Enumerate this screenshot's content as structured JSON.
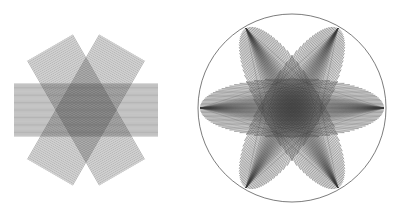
{
  "canvas": {
    "width": 398,
    "height": 220,
    "background": "#ffffff",
    "stroke_color": "#3a3a3a",
    "stroke_width": 0.38,
    "title": ""
  },
  "figures": [
    {
      "id": "left-figure",
      "name": "three-overlapping-line-bands-star",
      "label": "",
      "center": {
        "x": 86,
        "y": 110
      },
      "shape": "rectangular-bands",
      "band_count": 3,
      "band_angles_deg": [
        0,
        60,
        120
      ],
      "band_half_width": 26,
      "band_half_length": 72,
      "line_count_per_band": 46,
      "line_spacing_px": 1.15,
      "stroke_color": "#3a3a3a",
      "stroke_width": 0.38,
      "bounds": {
        "x_min": 14,
        "x_max": 158,
        "y_min": 34,
        "y_max": 186
      },
      "has_outline_circle": false
    },
    {
      "id": "right-figure",
      "name": "three-overlapping-lens-petals-in-circle",
      "label": "",
      "center": {
        "x": 292,
        "y": 108
      },
      "shape": "lens-petals",
      "band_count": 3,
      "band_angles_deg": [
        0,
        60,
        120
      ],
      "petal_half_length": 92,
      "petal_half_width": 30,
      "line_count_per_band": 46,
      "stroke_color": "#3a3a3a",
      "stroke_width": 0.38,
      "bounds": {
        "x_min": 198,
        "x_max": 386,
        "y_min": 13,
        "y_max": 205
      },
      "has_outline_circle": true,
      "circle": {
        "cx": 292,
        "cy": 108,
        "r": 94,
        "stroke_color": "#444444",
        "stroke_width": 0.7
      }
    }
  ],
  "annotations": {
    "caption": "",
    "footnote": ""
  }
}
